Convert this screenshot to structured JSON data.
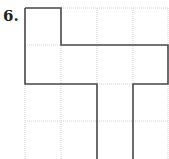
{
  "problem": {
    "number": "6.",
    "description": "Polyomino figure drawn on a 4x4 square grid"
  },
  "grid": {
    "columns": 4,
    "rows": 4,
    "origin_x": 25,
    "origin_y": 8,
    "cell_size": 36.5,
    "grid_color": "#cfcfcf",
    "outline_color": "#444444"
  },
  "shape": {
    "cells": [
      [
        0,
        0
      ],
      [
        0,
        1
      ],
      [
        1,
        1
      ],
      [
        2,
        1
      ],
      [
        3,
        1
      ],
      [
        2,
        2
      ],
      [
        2,
        3
      ]
    ]
  }
}
